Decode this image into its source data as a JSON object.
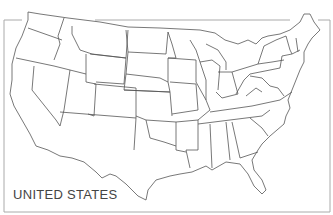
{
  "map": {
    "title": "UNITED STATES",
    "stroke_color": "#555555",
    "frame_color": "#aaaaaa",
    "regions": [
      "WA",
      "OR",
      "CA",
      "ID",
      "NV",
      "MT",
      "WY",
      "UT",
      "AZ",
      "CO",
      "NM",
      "ND",
      "SD",
      "NE",
      "KS",
      "OK",
      "TX",
      "MN",
      "IA",
      "MO",
      "AR",
      "LA",
      "WI",
      "IL",
      "MS",
      "MI",
      "IN",
      "KY",
      "TN",
      "AL",
      "OH",
      "GA",
      "FL",
      "SC",
      "NC",
      "VA",
      "WV",
      "PA",
      "NY",
      "MD",
      "DE",
      "NJ",
      "CT",
      "RI",
      "MA",
      "VT",
      "NH",
      "ME"
    ]
  }
}
